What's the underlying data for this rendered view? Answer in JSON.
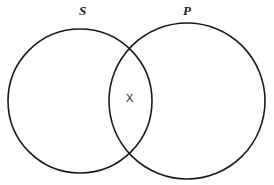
{
  "diagram": {
    "type": "venn-two-set",
    "title": "",
    "background_color": "#ffffff",
    "stroke_color": "#1a1a1a",
    "labels": {
      "left_set": "S",
      "right_set": "P",
      "intersection_mark": "X"
    },
    "circles": [
      {
        "name": "left-circle",
        "label": "S",
        "cx": 80,
        "cy": 101,
        "r": 72
      },
      {
        "name": "right-circle",
        "label": "P",
        "cx": 187,
        "cy": 101,
        "r": 78
      }
    ]
  }
}
